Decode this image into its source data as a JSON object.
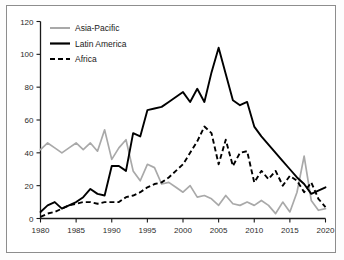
{
  "figure": {
    "background_color": "#ffffff",
    "frame_color": "#8d8d8d"
  },
  "chart_data": {
    "type": "line",
    "title": "",
    "subtitle": "",
    "xlabel": "",
    "ylabel": "",
    "xlim": [
      1980,
      2020
    ],
    "ylim": [
      0,
      120
    ],
    "xticks": [
      1980,
      1985,
      1990,
      1995,
      2000,
      2005,
      2010,
      2015,
      2020
    ],
    "yticks": [
      0,
      20,
      40,
      60,
      80,
      100,
      120
    ],
    "xtick_labels": [
      "1980",
      "1985",
      "1990",
      "1995",
      "2000",
      "2005",
      "2010",
      "2015",
      "2020"
    ],
    "ytick_labels": [
      "0",
      "20",
      "40",
      "60",
      "80",
      "100",
      "120"
    ],
    "grid": false,
    "legend_position": "upper-left",
    "x": [
      1980,
      1981,
      1982,
      1983,
      1984,
      1985,
      1986,
      1987,
      1988,
      1989,
      1990,
      1991,
      1992,
      1993,
      1994,
      1995,
      1996,
      1997,
      1998,
      1999,
      2000,
      2001,
      2002,
      2003,
      2004,
      2005,
      2006,
      2007,
      2008,
      2009,
      2010,
      2011,
      2012,
      2013,
      2014,
      2015,
      2016,
      2017,
      2018,
      2019,
      2020
    ],
    "series": [
      {
        "name": "Asia-Pacific",
        "color": "#a9a9a9",
        "style": "solid",
        "values": [
          42,
          46,
          43,
          40,
          43,
          46,
          42,
          46,
          41,
          54,
          36,
          43,
          48,
          29,
          23,
          33,
          31,
          21,
          22,
          19,
          16,
          20,
          13,
          14,
          12,
          8,
          14,
          9,
          8,
          10,
          8,
          11,
          8,
          3,
          10,
          4,
          16,
          38,
          11,
          5,
          6
        ]
      },
      {
        "name": "Latin America",
        "color": "#000000",
        "style": "solid",
        "values": [
          4,
          8,
          10,
          6,
          8,
          10,
          13,
          18,
          15,
          14,
          32,
          32,
          29,
          52,
          50,
          66,
          67,
          68,
          71,
          74,
          77,
          71,
          79,
          71,
          89,
          104,
          88,
          72,
          69,
          71,
          56,
          50,
          45,
          40,
          35,
          30,
          25,
          21,
          15,
          17,
          19
        ]
      },
      {
        "name": "Africa",
        "color": "#000000",
        "style": "dashed",
        "values": [
          1,
          3,
          4,
          6,
          8,
          9,
          10,
          10,
          9,
          10,
          10,
          10,
          13,
          14,
          16,
          19,
          21,
          22,
          25,
          29,
          33,
          40,
          47,
          56,
          52,
          33,
          48,
          32,
          40,
          41,
          22,
          29,
          24,
          29,
          20,
          26,
          23,
          16,
          22,
          12,
          7
        ]
      }
    ],
    "annotations": []
  },
  "legend": {
    "items": [
      {
        "label": "Asia-Pacific"
      },
      {
        "label": "Latin America"
      },
      {
        "label": "Africa"
      }
    ]
  }
}
